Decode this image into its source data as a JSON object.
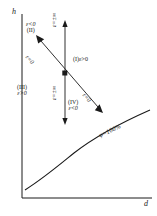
{
  "figure": {
    "kind": "h-d diagram",
    "axes": {
      "y_label": "h",
      "x_label": "d"
    },
    "quadrants": [
      {
        "id": "I",
        "roman": "(I)",
        "epsilon": "ε>0",
        "inline": "(I)ε>0"
      },
      {
        "id": "II",
        "roman": "(II)",
        "epsilon": "ε<0"
      },
      {
        "id": "III",
        "roman": "(III)",
        "epsilon": "ε>0"
      },
      {
        "id": "IV",
        "roman": "(IV)",
        "epsilon": "ε<0"
      }
    ],
    "lines": {
      "diagonal_label_upper": "ε=0",
      "diagonal_label_lower": "ε=0",
      "vertical_label_upper": "ε=±∞",
      "vertical_label_lower": "ε=±∞"
    },
    "curve": {
      "label": "φ=100%"
    },
    "colors": {
      "ink": "#1a1a1a",
      "background": "#ffffff"
    }
  }
}
